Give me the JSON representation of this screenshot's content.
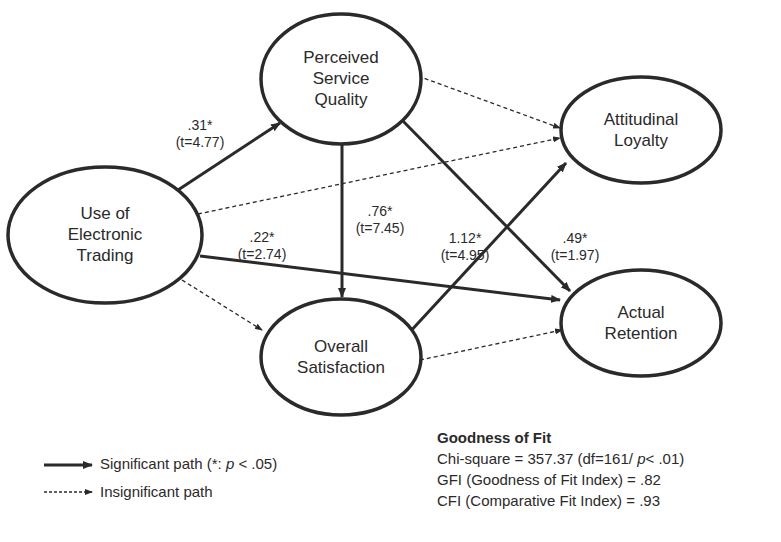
{
  "nodes": {
    "use": "Use of\nElectronic\nTrading",
    "psq": "Perceived\nService\nQuality",
    "os": "Overall\nSatisfaction",
    "al": "Attitudinal\nLoyalty",
    "ar": "Actual\nRetention"
  },
  "paths": [
    {
      "from": "use",
      "to": "psq",
      "type": "significant",
      "coef": ".31*",
      "t": "(t=4.77)"
    },
    {
      "from": "use",
      "to": "ar",
      "type": "significant",
      "coef": ".22*",
      "t": "(t=2.74)"
    },
    {
      "from": "psq",
      "to": "os",
      "type": "significant",
      "coef": ".76*",
      "t": "(t=7.45)"
    },
    {
      "from": "os",
      "to": "al",
      "type": "significant",
      "coef": "1.12*",
      "t": "(t=4.95)"
    },
    {
      "from": "psq",
      "to": "ar",
      "type": "significant",
      "coef": ".49*",
      "t": "(t=1.97)"
    },
    {
      "from": "use",
      "to": "al",
      "type": "insignificant"
    },
    {
      "from": "psq",
      "to": "al",
      "type": "insignificant"
    },
    {
      "from": "use",
      "to": "os",
      "type": "insignificant"
    },
    {
      "from": "os",
      "to": "ar",
      "type": "insignificant"
    }
  ],
  "legend": {
    "significant": "Significant path (*: ",
    "significant_p": "p",
    "significant_tail": " < .05)",
    "insignificant": "Insignificant path"
  },
  "fit": {
    "title": "Goodness of Fit",
    "chi": "Chi-square = 357.37 (df=161/ ",
    "chi_p": "p",
    "chi_tail": "< .01)",
    "gfi": "GFI (Goodness of Fit Index) = .82",
    "cfi": "CFI (Comparative Fit Index) = .93"
  }
}
